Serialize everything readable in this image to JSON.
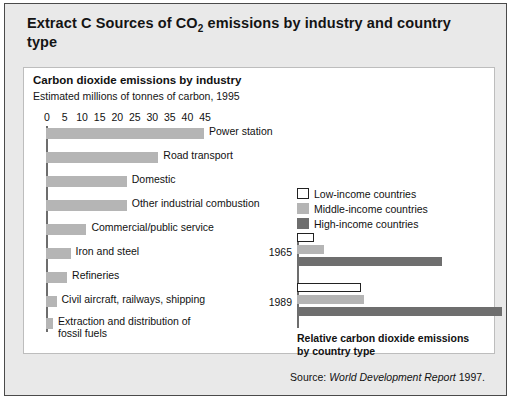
{
  "figure": {
    "title_prefix": "Extract C  Sources of CO",
    "title_sub": "2",
    "title_rest": " emissions by industry and country type",
    "source_prefix": "Source: ",
    "source_title": "World Development Report",
    "source_year": " 1997."
  },
  "left_chart": {
    "heading": "Carbon dioxide emissions by industry",
    "subheading": "Estimated millions of tonnes of carbon, 1995"
  },
  "right_chart": {
    "caption_line1": "Relative carbon dioxide emissions",
    "caption_line2": "by country type"
  },
  "colors": {
    "page_background": "#e9e9e9",
    "panel_background": "#ffffff",
    "bar_gray": "#b5b5b5",
    "low_income": "#ffffff",
    "middle_income": "#b5b5b5",
    "high_income": "#6e6e6e",
    "axis": "#6d6d6d",
    "text": "#111111"
  },
  "chart_data": [
    {
      "type": "bar",
      "orientation": "horizontal",
      "title": "Carbon dioxide emissions by industry",
      "subtitle": "Estimated millions of tonnes of carbon, 1995",
      "xlabel": "Estimated millions of tonnes of carbon, 1995",
      "ylabel": "",
      "xlim": [
        0,
        45
      ],
      "ticks": [
        0,
        5,
        10,
        15,
        20,
        25,
        30,
        35,
        40,
        45
      ],
      "grid": false,
      "legend": "none",
      "categories": [
        "Power station",
        "Road transport",
        "Domestic",
        "Other industrial combustion",
        "Commercial/public service",
        "Iron and steel",
        "Refineries",
        "Civil aircraft, railways, shipping",
        "Extraction and distribution of fossil fuels"
      ],
      "values": [
        45,
        32,
        23,
        23,
        11.5,
        7,
        6,
        3,
        2
      ]
    },
    {
      "type": "bar",
      "orientation": "horizontal",
      "title": "Relative carbon dioxide emissions by country type",
      "xlabel": "",
      "ylabel": "",
      "grid": false,
      "legend_position": "top-right",
      "categories": [
        "1965",
        "1989"
      ],
      "series": [
        {
          "name": "Low-income countries",
          "values": [
            5,
            19
          ]
        },
        {
          "name": "Middle-income countries",
          "values": [
            8,
            20
          ]
        },
        {
          "name": "High-income countries",
          "values": [
            43,
            61
          ]
        }
      ]
    }
  ]
}
